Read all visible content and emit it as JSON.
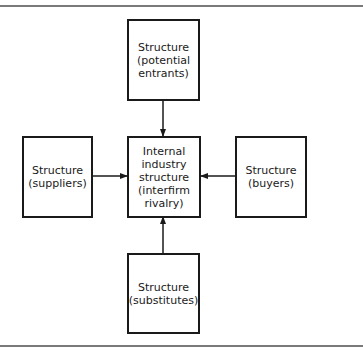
{
  "diagram": {
    "type": "five-forces-structure",
    "boxes": {
      "top": {
        "line1": "Structure",
        "line2": "(potential",
        "line3": "entrants)"
      },
      "left": {
        "line1": "Structure",
        "line2": "(suppliers)"
      },
      "center": {
        "line1": "Internal",
        "line2": "industry",
        "line3": "structure",
        "line4": "(interfirm",
        "line5": "rivalry)"
      },
      "right": {
        "line1": "Structure",
        "line2": "(buyers)"
      },
      "bottom": {
        "line1": "Structure",
        "line2": "(substitutes)"
      }
    },
    "edges": [
      {
        "from": "top",
        "to": "center"
      },
      {
        "from": "left",
        "to": "center"
      },
      {
        "from": "right",
        "to": "center"
      },
      {
        "from": "bottom",
        "to": "center"
      }
    ],
    "colors": {
      "line": "#1a1a1a",
      "rule": "#7a7a7a",
      "background": "#ffffff"
    }
  }
}
